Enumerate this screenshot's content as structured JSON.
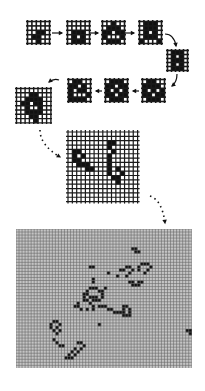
{
  "colors": {
    "background": "#ffffff",
    "ink": "#111111",
    "grid_line": "#1a1a1a",
    "dense_grid_bg": "#9a9a9a",
    "dense_grid_line": "#6a6a6a"
  },
  "grids": [
    {
      "id": "stage-1",
      "x": 27,
      "y": 21,
      "cols": 5,
      "rows": 5,
      "cell": 4.4,
      "line": 1.6,
      "overhang": 1.5,
      "cells": [
        [
          2,
          2
        ],
        [
          3,
          2
        ],
        [
          1,
          3
        ],
        [
          2,
          3
        ],
        [
          2,
          4
        ]
      ]
    },
    {
      "id": "stage-2",
      "x": 67,
      "y": 21,
      "cols": 5,
      "rows": 5,
      "cell": 4.4,
      "line": 1.6,
      "overhang": 1.5,
      "cells": [
        [
          1,
          2
        ],
        [
          2,
          2
        ],
        [
          3,
          2
        ],
        [
          1,
          3
        ],
        [
          3,
          3
        ],
        [
          1,
          4
        ],
        [
          2,
          4
        ],
        [
          3,
          4
        ]
      ]
    },
    {
      "id": "stage-3",
      "x": 102,
      "y": 21,
      "cols": 5,
      "rows": 5,
      "cell": 4.4,
      "line": 1.6,
      "overhang": 1.5,
      "cells": [
        [
          2,
          0
        ],
        [
          1,
          1
        ],
        [
          2,
          1
        ],
        [
          3,
          1
        ],
        [
          0,
          2
        ],
        [
          1,
          2
        ],
        [
          3,
          2
        ],
        [
          4,
          2
        ],
        [
          0,
          3
        ],
        [
          4,
          3
        ],
        [
          1,
          4
        ],
        [
          2,
          4
        ],
        [
          3,
          4
        ]
      ]
    },
    {
      "id": "stage-4",
      "x": 139,
      "y": 21,
      "cols": 5,
      "rows": 5,
      "cell": 4.4,
      "line": 1.6,
      "overhang": 1.5,
      "cells": [
        [
          1,
          0
        ],
        [
          2,
          0
        ],
        [
          3,
          0
        ],
        [
          1,
          1
        ],
        [
          2,
          1
        ],
        [
          3,
          1
        ],
        [
          1,
          2
        ],
        [
          3,
          2
        ],
        [
          1,
          3
        ],
        [
          2,
          3
        ],
        [
          3,
          3
        ],
        [
          0,
          4
        ],
        [
          4,
          4
        ]
      ]
    },
    {
      "id": "stage-5",
      "x": 167,
      "y": 50,
      "cols": 5,
      "rows": 5,
      "cell": 4.0,
      "line": 1.6,
      "overhang": 1.5,
      "cells": [
        [
          1,
          0
        ],
        [
          2,
          0
        ],
        [
          3,
          0
        ],
        [
          1,
          1
        ],
        [
          3,
          1
        ],
        [
          1,
          2
        ],
        [
          2,
          2
        ],
        [
          3,
          2
        ],
        [
          1,
          3
        ],
        [
          3,
          3
        ],
        [
          1,
          4
        ],
        [
          2,
          4
        ],
        [
          3,
          4
        ]
      ]
    },
    {
      "id": "stage-6",
      "x": 142,
      "y": 79,
      "cols": 5,
      "rows": 5,
      "cell": 4.4,
      "line": 1.6,
      "overhang": 1.5,
      "cells": [
        [
          1,
          0
        ],
        [
          2,
          0
        ],
        [
          0,
          1
        ],
        [
          1,
          1
        ],
        [
          2,
          1
        ],
        [
          3,
          1
        ],
        [
          0,
          2
        ],
        [
          2,
          2
        ],
        [
          4,
          2
        ],
        [
          0,
          3
        ],
        [
          1,
          3
        ],
        [
          3,
          3
        ],
        [
          4,
          3
        ],
        [
          1,
          4
        ],
        [
          2,
          4
        ],
        [
          3,
          4
        ]
      ]
    },
    {
      "id": "stage-7",
      "x": 105,
      "y": 79,
      "cols": 5,
      "rows": 5,
      "cell": 4.4,
      "line": 1.6,
      "overhang": 1.5,
      "cells": [
        [
          1,
          0
        ],
        [
          2,
          0
        ],
        [
          3,
          0
        ],
        [
          0,
          1
        ],
        [
          1,
          1
        ],
        [
          3,
          1
        ],
        [
          4,
          1
        ],
        [
          0,
          2
        ],
        [
          2,
          2
        ],
        [
          4,
          2
        ],
        [
          0,
          3
        ],
        [
          1,
          3
        ],
        [
          3,
          3
        ],
        [
          4,
          3
        ],
        [
          1,
          4
        ],
        [
          2,
          4
        ],
        [
          3,
          4
        ]
      ]
    },
    {
      "id": "stage-8",
      "x": 68,
      "y": 79,
      "cols": 5,
      "rows": 5,
      "cell": 4.4,
      "line": 1.6,
      "overhang": 1.5,
      "cells": [
        [
          1,
          0
        ],
        [
          2,
          0
        ],
        [
          0,
          1
        ],
        [
          1,
          1
        ],
        [
          3,
          1
        ],
        [
          0,
          2
        ],
        [
          2,
          2
        ],
        [
          3,
          2
        ],
        [
          0,
          3
        ],
        [
          4,
          3
        ],
        [
          0,
          4
        ],
        [
          1,
          4
        ],
        [
          2,
          4
        ],
        [
          3,
          4
        ]
      ]
    },
    {
      "id": "stage-9",
      "x": 16,
      "y": 88,
      "cols": 8,
      "rows": 8,
      "cell": 4.3,
      "line": 1.4,
      "overhang": 1.5,
      "cells": [
        [
          3,
          1
        ],
        [
          4,
          1
        ],
        [
          2,
          2
        ],
        [
          3,
          2
        ],
        [
          4,
          2
        ],
        [
          5,
          2
        ],
        [
          1,
          3
        ],
        [
          2,
          3
        ],
        [
          4,
          3
        ],
        [
          5,
          3
        ],
        [
          2,
          4
        ],
        [
          5,
          4
        ],
        [
          2,
          5
        ],
        [
          3,
          5
        ],
        [
          4,
          5
        ],
        [
          5,
          5
        ],
        [
          3,
          6
        ],
        [
          4,
          6
        ],
        [
          4,
          7
        ]
      ]
    },
    {
      "id": "stage-10",
      "x": 68,
      "y": 132,
      "cols": 16,
      "rows": 16,
      "cell": 4.35,
      "line": 1.2,
      "overhang": 2,
      "cells": [
        [
          1,
          4
        ],
        [
          2,
          4
        ],
        [
          1,
          5
        ],
        [
          3,
          5
        ],
        [
          1,
          6
        ],
        [
          2,
          6
        ],
        [
          2,
          7
        ],
        [
          3,
          7
        ],
        [
          4,
          7
        ],
        [
          4,
          8
        ],
        [
          5,
          8
        ],
        [
          9,
          2
        ],
        [
          10,
          2
        ],
        [
          9,
          3
        ],
        [
          10,
          4
        ],
        [
          9,
          5
        ],
        [
          9,
          6
        ],
        [
          9,
          7
        ],
        [
          9,
          8
        ],
        [
          11,
          8
        ],
        [
          9,
          9
        ],
        [
          12,
          9
        ],
        [
          10,
          10
        ],
        [
          11,
          10
        ],
        [
          11,
          11
        ]
      ]
    },
    {
      "id": "stage-11-dense",
      "x": 16,
      "y": 229,
      "cols": 58,
      "rows": 46,
      "cell": 3.03,
      "line": 0.6,
      "overhang": 0,
      "dense": true,
      "cells": [
        [
          111,
          3
        ],
        [
          112,
          4
        ],
        [
          113,
          5
        ],
        [
          36,
          11
        ],
        [
          37,
          11
        ],
        [
          38,
          11
        ],
        [
          37,
          15
        ],
        [
          37,
          16
        ],
        [
          37,
          17
        ],
        [
          36,
          19
        ],
        [
          37,
          19
        ],
        [
          39,
          20
        ],
        [
          40,
          20
        ],
        [
          41,
          20
        ],
        [
          35,
          21
        ],
        [
          39,
          21
        ],
        [
          42,
          21
        ],
        [
          35,
          22
        ],
        [
          36,
          22
        ],
        [
          42,
          22
        ],
        [
          39,
          23
        ],
        [
          42,
          23
        ],
        [
          40,
          24
        ],
        [
          41,
          24
        ],
        [
          26,
          25
        ],
        [
          27,
          26
        ],
        [
          26,
          27
        ],
        [
          28,
          28
        ],
        [
          27,
          28
        ],
        [
          29,
          30
        ],
        [
          28,
          31
        ],
        [
          29,
          32
        ],
        [
          30,
          34
        ],
        [
          31,
          34
        ],
        [
          32,
          34
        ],
        [
          33,
          34
        ],
        [
          41,
          31
        ],
        [
          42,
          32
        ],
        [
          44,
          33
        ],
        [
          45,
          34
        ],
        [
          43,
          34
        ],
        [
          41,
          35
        ],
        [
          40,
          36
        ],
        [
          42,
          36
        ],
        [
          44,
          36
        ],
        [
          43,
          37
        ],
        [
          45,
          37
        ],
        [
          55,
          35
        ],
        [
          64,
          39
        ],
        [
          19,
          27
        ],
        [
          20,
          27
        ]
      ]
    }
  ],
  "dense_patterns": [
    {
      "name": "glider-top-right",
      "cells": [
        [
          38,
          6
        ],
        [
          39,
          6
        ],
        [
          39,
          7
        ],
        [
          40,
          7
        ]
      ]
    },
    {
      "name": "dot-mid-right",
      "cells": [
        [
          30,
          14
        ]
      ]
    },
    {
      "name": "cluster-right",
      "cells": [
        [
          34,
          13
        ],
        [
          35,
          13
        ],
        [
          36,
          12
        ],
        [
          37,
          12
        ],
        [
          38,
          13
        ],
        [
          37,
          14
        ],
        [
          36,
          15
        ],
        [
          41,
          11
        ],
        [
          42,
          11
        ],
        [
          43,
          11
        ],
        [
          40,
          12
        ],
        [
          44,
          12
        ],
        [
          40,
          13
        ],
        [
          43,
          13
        ],
        [
          42,
          14
        ],
        [
          33,
          15
        ]
      ]
    },
    {
      "name": "bracket-right",
      "cells": [
        [
          37,
          17
        ],
        [
          38,
          17
        ],
        [
          40,
          17
        ],
        [
          41,
          17
        ],
        [
          38,
          18
        ],
        [
          40,
          18
        ],
        [
          39,
          18
        ]
      ]
    },
    {
      "name": "dot-left-mid",
      "cells": [
        [
          29,
          19
        ]
      ]
    },
    {
      "name": "ring-center",
      "cells": [
        [
          22,
          21
        ],
        [
          23,
          21
        ],
        [
          24,
          22
        ],
        [
          22,
          23
        ],
        [
          20,
          24
        ],
        [
          24,
          24
        ],
        [
          20,
          25
        ],
        [
          25,
          25
        ],
        [
          21,
          26
        ],
        [
          23,
          26
        ],
        [
          25,
          26
        ],
        [
          19,
          25
        ]
      ]
    },
    {
      "name": "bar-center",
      "cells": [
        [
          27,
          25
        ],
        [
          28,
          25
        ],
        [
          29,
          25
        ],
        [
          30,
          26
        ],
        [
          31,
          26
        ],
        [
          32,
          27
        ],
        [
          33,
          27
        ],
        [
          34,
          27
        ]
      ]
    },
    {
      "name": "box-center-right",
      "cells": [
        [
          35,
          25
        ],
        [
          36,
          25
        ],
        [
          35,
          26
        ],
        [
          37,
          26
        ],
        [
          35,
          27
        ],
        [
          37,
          27
        ],
        [
          35,
          28
        ],
        [
          36,
          28
        ],
        [
          37,
          28
        ]
      ]
    },
    {
      "name": "upper-left-stick",
      "cells": [
        [
          24,
          12
        ],
        [
          25,
          12
        ],
        [
          25,
          16
        ],
        [
          25,
          17
        ]
      ]
    },
    {
      "name": "upper-left-ring",
      "cells": [
        [
          24,
          19
        ],
        [
          25,
          19
        ],
        [
          26,
          19
        ],
        [
          23,
          20
        ],
        [
          27,
          20
        ],
        [
          28,
          20
        ],
        [
          22,
          21
        ],
        [
          28,
          21
        ],
        [
          22,
          22
        ],
        [
          25,
          22
        ],
        [
          26,
          22
        ],
        [
          28,
          22
        ],
        [
          23,
          23
        ],
        [
          25,
          23
        ],
        [
          26,
          23
        ],
        [
          27,
          23
        ]
      ]
    },
    {
      "name": "left-c",
      "cells": [
        [
          12,
          30
        ],
        [
          13,
          30
        ],
        [
          11,
          31
        ],
        [
          14,
          31
        ],
        [
          11,
          32
        ],
        [
          13,
          32
        ],
        [
          12,
          33
        ],
        [
          14,
          33
        ],
        [
          13,
          34
        ],
        [
          12,
          36
        ],
        [
          13,
          37
        ],
        [
          14,
          38
        ],
        [
          15,
          38
        ]
      ]
    },
    {
      "name": "left-hook",
      "cells": [
        [
          20,
          37
        ],
        [
          21,
          37
        ],
        [
          22,
          38
        ],
        [
          19,
          39
        ],
        [
          21,
          39
        ],
        [
          18,
          40
        ],
        [
          20,
          40
        ],
        [
          17,
          41
        ],
        [
          19,
          41
        ],
        [
          16,
          42
        ],
        [
          17,
          42
        ],
        [
          18,
          42
        ]
      ]
    },
    {
      "name": "dot-center-left",
      "cells": [
        [
          27,
          31
        ]
      ]
    },
    {
      "name": "bottom-left-glider",
      "cells": [
        [
          24,
          49
        ],
        [
          25,
          49
        ],
        [
          23,
          50
        ],
        [
          24,
          50
        ],
        [
          25,
          51
        ]
      ]
    },
    {
      "name": "right-edge-glider",
      "cells": [
        [
          56,
          33
        ],
        [
          57,
          33
        ],
        [
          57,
          34
        ]
      ]
    }
  ],
  "arrows": [
    {
      "id": "arrow-1-2",
      "x1": 52,
      "y1": 33,
      "x2": 62,
      "y2": 33,
      "style": "solid-short"
    },
    {
      "id": "arrow-2-3",
      "x1": 90,
      "y1": 33,
      "x2": 98,
      "y2": 33,
      "style": "solid-short"
    },
    {
      "id": "arrow-3-4",
      "x1": 125,
      "y1": 33,
      "x2": 134,
      "y2": 33,
      "style": "solid-short"
    },
    {
      "id": "arrow-4-5",
      "x1": 165,
      "y1": 34,
      "x2": 176,
      "y2": 46,
      "style": "curved",
      "cx": 174,
      "cy": 34
    },
    {
      "id": "arrow-5-6",
      "x1": 177,
      "y1": 74,
      "x2": 172,
      "y2": 86,
      "style": "curved",
      "cx": 177,
      "cy": 82
    },
    {
      "id": "arrow-6-7",
      "x1": 139,
      "y1": 91,
      "x2": 133,
      "y2": 91,
      "style": "solid-short"
    },
    {
      "id": "arrow-7-8",
      "x1": 102,
      "y1": 91,
      "x2": 96,
      "y2": 91,
      "style": "solid-short"
    },
    {
      "id": "arrow-8-9",
      "x1": 59,
      "y1": 80,
      "x2": 49,
      "y2": 82,
      "style": "curved",
      "cx": 54,
      "cy": 78
    },
    {
      "id": "arrow-9-10",
      "x1": 40,
      "y1": 130,
      "x2": 60,
      "y2": 157,
      "style": "dotted",
      "cx": 40,
      "cy": 145
    },
    {
      "id": "arrow-10-11",
      "x1": 150,
      "y1": 196,
      "x2": 165,
      "y2": 223,
      "style": "dotted",
      "cx": 162,
      "cy": 200
    }
  ]
}
